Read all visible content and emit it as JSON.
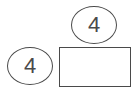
{
  "diagram": {
    "top_circle": {
      "value": "4"
    },
    "left_circle": {
      "value": "4"
    },
    "answer_box": {
      "value": ""
    }
  },
  "colors": {
    "stroke": "#4a4a4a",
    "background": "#ffffff"
  }
}
